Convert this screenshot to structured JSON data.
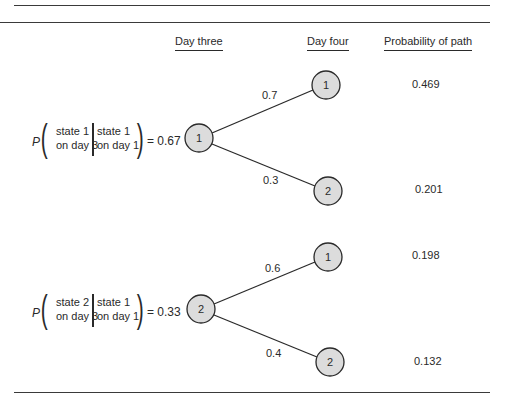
{
  "headers": {
    "day_three": "Day three",
    "day_four": "Day four",
    "path_probability": "Probability of path"
  },
  "formulas": [
    {
      "P": "P",
      "event_line1": "state 1",
      "event_line2": "on day 3",
      "given_line1": "state 1",
      "given_line2": "on day 1",
      "equals": "= 0.67"
    },
    {
      "P": "P",
      "event_line1": "state 2",
      "event_line2": "on day 3",
      "given_line1": "state 1",
      "given_line2": "on day 1",
      "equals": "= 0.33"
    }
  ],
  "tree": {
    "day_three_nodes": [
      {
        "label": "1",
        "probability": 0.67
      },
      {
        "label": "2",
        "probability": 0.33
      }
    ],
    "day_four_nodes": [
      {
        "label": "1"
      },
      {
        "label": "2"
      },
      {
        "label": "1"
      },
      {
        "label": "2"
      }
    ],
    "edges": [
      {
        "from": "day3-1",
        "to": "day4-1",
        "label": "0.7"
      },
      {
        "from": "day3-1",
        "to": "day4-2",
        "label": "0.3"
      },
      {
        "from": "day3-2",
        "to": "day4-1",
        "label": "0.6"
      },
      {
        "from": "day3-2",
        "to": "day4-2",
        "label": "0.4"
      }
    ],
    "path_probabilities": [
      "0.469",
      "0.201",
      "0.198",
      "0.132"
    ]
  },
  "colors": {
    "node_fill": "#dcdcdc",
    "stroke": "#2a2a2a",
    "rule": "#3a3a3a"
  }
}
